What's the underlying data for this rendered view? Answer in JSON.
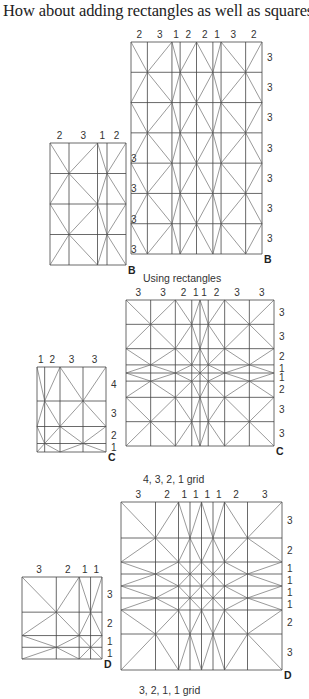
{
  "heading": "How about adding rectangles as well as squares?",
  "sections": [
    {
      "caption": "Using rectangles",
      "figures": [
        {
          "id": "B-small",
          "letter": "B",
          "cols": [
            2,
            3,
            1,
            2
          ],
          "rows": [
            3,
            3,
            3,
            3
          ],
          "box": [
            50,
            143,
            76,
            122
          ]
        },
        {
          "id": "B-large",
          "letter": "B",
          "cols": [
            2,
            3,
            1,
            2,
            2,
            1,
            3,
            2
          ],
          "rows": [
            3,
            3,
            3,
            3,
            3,
            3,
            3
          ],
          "box": [
            131,
            42,
            131,
            212
          ]
        }
      ]
    },
    {
      "caption": "4, 3, 2, 1 grid",
      "figures": [
        {
          "id": "C-small",
          "letter": "C",
          "cols": [
            1,
            2,
            3,
            3
          ],
          "rows": [
            4,
            3,
            2,
            1
          ],
          "box": [
            37,
            367,
            69,
            85
          ]
        },
        {
          "id": "C-large",
          "letter": "C",
          "cols": [
            3,
            3,
            2,
            1,
            1,
            2,
            3,
            3
          ],
          "rows": [
            3,
            3,
            2,
            1,
            1,
            2,
            3,
            3
          ],
          "box": [
            126,
            300,
            148,
            146
          ]
        }
      ]
    },
    {
      "caption": "3, 2, 1, 1 grid",
      "figures": [
        {
          "id": "D-small",
          "letter": "D",
          "cols": [
            3,
            2,
            1,
            1
          ],
          "rows": [
            3,
            2,
            1,
            1
          ],
          "box": [
            22,
            577,
            80,
            82
          ]
        },
        {
          "id": "D-large",
          "letter": "D",
          "cols": [
            3,
            2,
            1,
            1,
            1,
            1,
            2,
            3
          ],
          "rows": [
            3,
            2,
            1,
            1,
            1,
            1,
            2,
            3
          ],
          "box": [
            121,
            502,
            161,
            168
          ]
        }
      ]
    }
  ]
}
